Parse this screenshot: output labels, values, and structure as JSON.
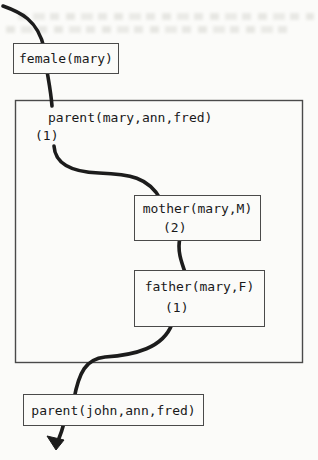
{
  "colors": {
    "background": "#fbfbf9",
    "flow_line": "#1c1c1c",
    "box_border": "#4a4a4a",
    "text": "#191919"
  },
  "nodes": {
    "female": {
      "label": "female(mary)"
    },
    "parent_clause": {
      "label": "parent(mary,ann,fred)",
      "annotation": "(1)"
    },
    "mother": {
      "label": "mother(mary,M)",
      "annotation": "(2)"
    },
    "father": {
      "label": "father(mary,F)",
      "annotation": "(1)"
    },
    "parent_john": {
      "label": "parent(john,ann,fred)"
    }
  }
}
